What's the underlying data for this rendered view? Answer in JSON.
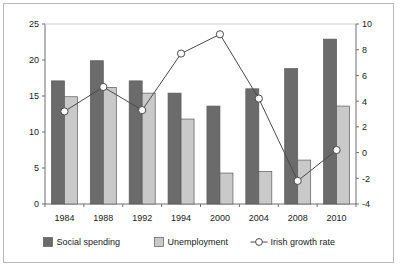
{
  "chart_data": {
    "type": "bar",
    "title": "",
    "subtitle": "",
    "xlabel": "",
    "ylabel": "",
    "categories": [
      "1984",
      "1988",
      "1992",
      "1994",
      "2000",
      "2004",
      "2008",
      "2010"
    ],
    "series": [
      {
        "name": "Social spending",
        "type": "bar",
        "axis": "left",
        "color": "#6b6b6b",
        "values": [
          17.1,
          19.9,
          17.1,
          15.4,
          13.6,
          16.0,
          18.8,
          22.9
        ]
      },
      {
        "name": "Unemployment",
        "type": "bar",
        "axis": "left",
        "color": "#c9c9c9",
        "values": [
          14.9,
          16.2,
          15.4,
          11.8,
          4.3,
          4.5,
          6.1,
          13.6
        ]
      },
      {
        "name": "Irish growth rate",
        "type": "line",
        "axis": "right",
        "color": "#4a4a4a",
        "marker": "open-circle",
        "values": [
          3.2,
          5.1,
          3.3,
          7.7,
          9.2,
          4.2,
          -2.2,
          0.2
        ]
      }
    ],
    "left_axis": {
      "ylim": [
        0,
        25
      ],
      "ticks": [
        0,
        5,
        10,
        15,
        20,
        25
      ],
      "tick_labels": [
        "0",
        "5",
        "10",
        "15",
        "20",
        "25"
      ]
    },
    "right_axis": {
      "ylim": [
        -4,
        10
      ],
      "ticks": [
        -4,
        -2,
        0,
        2,
        4,
        6,
        8,
        10
      ],
      "tick_labels": [
        "-4",
        "-2",
        "0",
        "2",
        "4",
        "6",
        "8",
        "10"
      ]
    },
    "grid": false,
    "legend_position": "bottom",
    "legend": [
      {
        "label": "Social spending",
        "marker": "dark-square",
        "color": "#6b6b6b"
      },
      {
        "label": "Unemployment",
        "marker": "light-square",
        "color": "#c9c9c9"
      },
      {
        "label": "Irish growth rate",
        "marker": "line-open-circle",
        "color": "#4a4a4a"
      }
    ]
  },
  "colors": {
    "social_spending": "#6b6b6b",
    "unemployment": "#c9c9c9",
    "growth_line": "#4a4a4a",
    "axis": "#6f6f6f",
    "frame_border": "#b9b9b9",
    "background": "#ffffff",
    "text": "#1a1a1a"
  }
}
